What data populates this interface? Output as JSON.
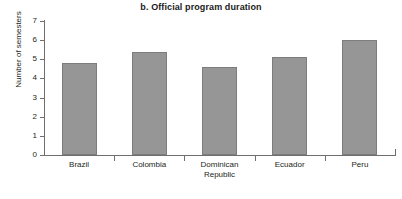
{
  "chart_data": {
    "type": "bar",
    "title": "b. Official program duration",
    "xlabel": "",
    "ylabel": "Number of semesters",
    "categories": [
      "Brazil",
      "Colombia",
      "Dominican Republic",
      "Ecuador",
      "Peru"
    ],
    "category_lines": [
      [
        "Brazil"
      ],
      [
        "Colombia"
      ],
      [
        "Dominican",
        "Republic"
      ],
      [
        "Ecuador"
      ],
      [
        "Peru"
      ]
    ],
    "values": [
      4.8,
      5.4,
      4.6,
      5.1,
      6.0
    ],
    "ylim": [
      0,
      7
    ],
    "yticks": [
      0,
      1,
      2,
      3,
      4,
      5,
      6,
      7
    ],
    "ytick_labels": [
      "0",
      "1",
      "2",
      "3",
      "4",
      "5",
      "6",
      "7"
    ],
    "grid": false,
    "legend": "none",
    "bar_color": "#969696",
    "bar_border_color": "#7d7d7d",
    "axis_color": "#6f6f6f",
    "background": "#ffffff"
  }
}
